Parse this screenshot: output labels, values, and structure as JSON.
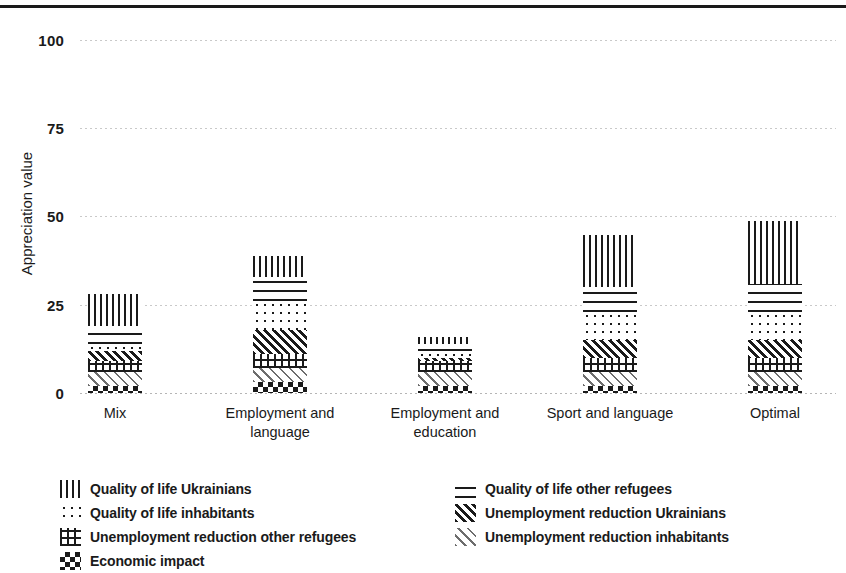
{
  "axes": {
    "ylabel": "Appreciation value",
    "yticks": [
      "100",
      "75",
      "50",
      "25",
      "0"
    ],
    "xticks": [
      "Mix",
      "Employment and language",
      "Employment and education",
      "Sport and language",
      "Optimal"
    ]
  },
  "legend": {
    "items": [
      {
        "label": "Quality of life Ukrainians",
        "pattern": "vertical-lines"
      },
      {
        "label": "Quality of life other refugees",
        "pattern": "horizontal-lines"
      },
      {
        "label": "Quality of life inhabitants",
        "pattern": "dots"
      },
      {
        "label": "Unemployment reduction Ukrainians",
        "pattern": "dense-diagonal"
      },
      {
        "label": "Unemployment reduction other refugees",
        "pattern": "cross-grid"
      },
      {
        "label": "Unemployment reduction inhabitants",
        "pattern": "light-diagonal"
      },
      {
        "label": "Economic impact",
        "pattern": "checker"
      }
    ]
  },
  "chart_data": {
    "type": "bar",
    "stacked": true,
    "title": "",
    "xlabel": "",
    "ylabel": "Appreciation value",
    "ylim": [
      0,
      100
    ],
    "yticks": [
      0,
      25,
      50,
      75,
      100
    ],
    "grid": true,
    "legend_position": "bottom",
    "categories": [
      "Mix",
      "Employment and language",
      "Employment and education",
      "Sport and language",
      "Optimal"
    ],
    "series": [
      {
        "name": "Economic impact",
        "values": [
          2,
          3,
          2,
          2,
          2
        ]
      },
      {
        "name": "Unemployment reduction inhabitants",
        "values": [
          4,
          4,
          4,
          4,
          4
        ]
      },
      {
        "name": "Unemployment reduction other refugees",
        "values": [
          3,
          4,
          3,
          4,
          4
        ]
      },
      {
        "name": "Unemployment reduction Ukrainians",
        "values": [
          3,
          7,
          1,
          5,
          5
        ]
      },
      {
        "name": "Quality of life inhabitants",
        "values": [
          2,
          8,
          2,
          8,
          8
        ]
      },
      {
        "name": "Quality of life other refugees",
        "values": [
          5,
          7,
          2,
          7,
          8
        ]
      },
      {
        "name": "Quality of life Ukrainians",
        "values": [
          9,
          6,
          2,
          15,
          18
        ]
      }
    ],
    "totals": [
      28,
      39,
      16,
      45,
      49
    ]
  },
  "colors": {
    "ink": "#1a1a1a",
    "grid": "#c9c9c9",
    "background": "#ffffff"
  }
}
